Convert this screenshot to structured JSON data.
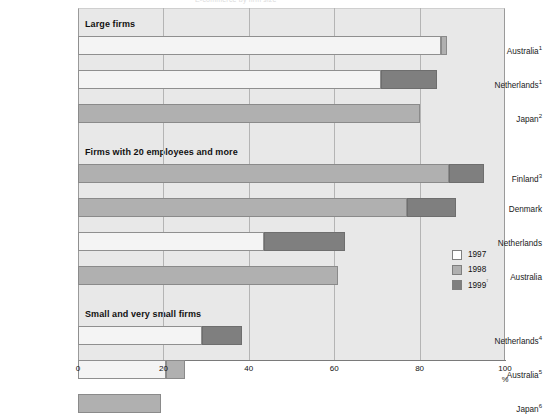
{
  "title_clipped": "E-commerce by firm size",
  "chart_data": {
    "type": "bar",
    "orientation": "horizontal",
    "stacked": false,
    "title": "",
    "xlabel": "%",
    "ylabel": "",
    "xlim": [
      0,
      100
    ],
    "xticks": [
      0,
      20,
      40,
      60,
      80,
      100
    ],
    "grid": true,
    "legend_position": "right-inside",
    "legend": [
      "1997",
      "1998",
      "1999⁷"
    ],
    "colors": {
      "1997": "#f4f4f4",
      "1998": "#b0b0b0",
      "1999": "#7f7f7f",
      "plot_background": "#e8e8e8",
      "gridline": "#b4b4b4",
      "bar_outline": "#8c8c8c"
    },
    "groups": [
      {
        "header": "Large firms",
        "rows": [
          {
            "label": "Australia",
            "sup": "1",
            "segments": [
              {
                "series": "1997",
                "start": 0,
                "end": 85.0
              },
              {
                "series": "1998",
                "start": 85.0,
                "end": 86.5
              }
            ]
          },
          {
            "label": "Netherlands",
            "sup": "1",
            "segments": [
              {
                "series": "1997",
                "start": 0,
                "end": 71.0
              },
              {
                "series": "1999",
                "start": 71.0,
                "end": 84.0
              }
            ]
          },
          {
            "label": "Japan",
            "sup": "2",
            "segments": [
              {
                "series": "1998",
                "start": 0,
                "end": 80.0
              }
            ]
          }
        ]
      },
      {
        "header": "Firms with 20 employees and more",
        "rows": [
          {
            "label": "Finland",
            "sup": "3",
            "segments": [
              {
                "series": "1998",
                "start": 0,
                "end": 87.0
              },
              {
                "series": "1999",
                "start": 87.0,
                "end": 95.0
              }
            ]
          },
          {
            "label": "Denmark",
            "sup": "",
            "segments": [
              {
                "series": "1998",
                "start": 0,
                "end": 77.0
              },
              {
                "series": "1999",
                "start": 77.0,
                "end": 88.5
              }
            ]
          },
          {
            "label": "Netherlands",
            "sup": "",
            "segments": [
              {
                "series": "1997",
                "start": 0,
                "end": 43.5
              },
              {
                "series": "1999",
                "start": 43.5,
                "end": 62.5
              }
            ]
          },
          {
            "label": "Australia",
            "sup": "",
            "segments": [
              {
                "series": "1998",
                "start": 0,
                "end": 61.0
              }
            ]
          }
        ]
      },
      {
        "header": "Small and very small firms",
        "rows": [
          {
            "label": "Netherlands",
            "sup": "4",
            "segments": [
              {
                "series": "1997",
                "start": 0,
                "end": 29.0
              },
              {
                "series": "1999",
                "start": 29.0,
                "end": 38.5
              }
            ]
          },
          {
            "label": "Australia",
            "sup": "5",
            "segments": [
              {
                "series": "1997",
                "start": 0,
                "end": 20.5
              },
              {
                "series": "1998",
                "start": 20.5,
                "end": 25.0
              }
            ]
          },
          {
            "label": "Japan",
            "sup": "6",
            "segments": [
              {
                "series": "1998",
                "start": 0,
                "end": 19.5
              }
            ]
          }
        ]
      }
    ]
  }
}
